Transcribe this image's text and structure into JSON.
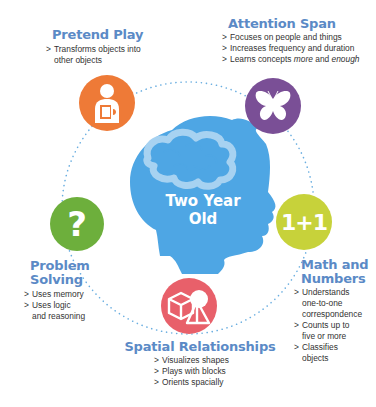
{
  "center": {
    "line1": "Two Year",
    "line2": "Old",
    "head_color": "#4ea6e4",
    "brain_color": "#a7d2f1",
    "icon": "child-head-brain-icon"
  },
  "ring": {
    "color": "#6aaee0",
    "style": "dotted"
  },
  "categories": [
    {
      "id": "pretend-play",
      "title": "Pretend Play",
      "icon": "child-with-book-icon",
      "color": "#ee7a37",
      "items": [
        "Transforms objects into other objects"
      ]
    },
    {
      "id": "attention-span",
      "title": "Attention Span",
      "icon": "butterfly-icon",
      "color": "#7a4f96",
      "items": [
        "Focuses on people and things",
        "Increases frequency and duration",
        "Learns concepts more and enough"
      ]
    },
    {
      "id": "math-and-numbers",
      "title_line1": "Math and",
      "title_line2": "Numbers",
      "icon": "one-plus-one-icon",
      "icon_text": "1+1",
      "color": "#c7d23a",
      "items": [
        "Understands one-to-one correspondence",
        "Counts up to five or more",
        "Classifies objects"
      ]
    },
    {
      "id": "spatial-relationships",
      "title": "Spatial Relationships",
      "icon": "blocks-shapes-icon",
      "color": "#e8606a",
      "items": [
        "Visualizes shapes",
        "Plays with blocks",
        "Orients spacially"
      ]
    },
    {
      "id": "problem-solving",
      "title_line1": "Problem",
      "title_line2": "Solving",
      "icon": "question-mark-icon",
      "icon_text": "?",
      "color": "#6daf3c",
      "items": [
        "Uses memory",
        "Uses logic and reasoning"
      ]
    }
  ],
  "attention_items_parts": {
    "prefix": "Learns concepts ",
    "em1": "more",
    "mid": " and ",
    "em2": "enough"
  },
  "math_items_lines": {
    "i1a": "Understands",
    "i1b": "one-to-one",
    "i1c": "correspondence",
    "i2a": "Counts up to",
    "i2b": "five or more",
    "i3a": "Classifies",
    "i3b": "objects"
  },
  "pretend_items_lines": {
    "a": "Transforms objects into",
    "b": "other objects"
  },
  "problem_items_lines": {
    "a": "Uses memory",
    "b": "Uses logic",
    "c": "and reasoning"
  }
}
